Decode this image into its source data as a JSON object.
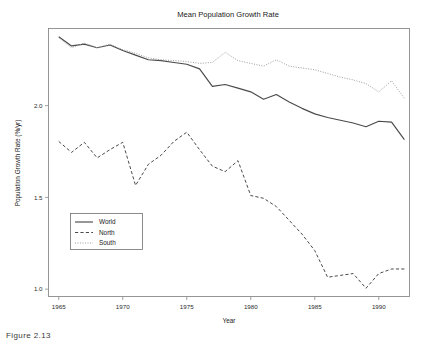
{
  "figure": {
    "caption": "Figure 2.13"
  },
  "chart_data": {
    "type": "line",
    "title": "Mean Population Growth Rate",
    "xlabel": "Year",
    "ylabel": "Population Growth Rate (%/yr)",
    "xlim": [
      1964.2,
      1992.4
    ],
    "ylim": [
      0.96,
      2.42
    ],
    "xticks": [
      1965,
      1970,
      1975,
      1980,
      1985,
      1990
    ],
    "xticklabels": [
      "1965",
      "1970",
      "1975",
      "1980",
      "1985",
      "1990"
    ],
    "yticks": [
      1.0,
      1.5,
      2.0
    ],
    "yticklabels": [
      "1.0",
      "1.5",
      "2.0"
    ],
    "grid": false,
    "legend_position": "lower left",
    "x": [
      1965,
      1966,
      1967,
      1968,
      1969,
      1970,
      1971,
      1972,
      1973,
      1974,
      1975,
      1976,
      1977,
      1978,
      1979,
      1980,
      1981,
      1982,
      1983,
      1984,
      1985,
      1986,
      1987,
      1988,
      1989,
      1990,
      1991,
      1992
    ],
    "series": [
      {
        "name": "World",
        "style": "solid",
        "color": "#4a4a4a",
        "width": 1.15,
        "values": [
          2.375,
          2.325,
          2.335,
          2.315,
          2.33,
          2.3,
          2.275,
          2.25,
          2.245,
          2.235,
          2.225,
          2.2,
          2.105,
          2.115,
          2.095,
          2.075,
          2.035,
          2.06,
          2.02,
          1.985,
          1.955,
          1.935,
          1.92,
          1.905,
          1.885,
          1.915,
          1.91,
          1.815
        ]
      },
      {
        "name": "North",
        "style": "dashed",
        "color": "#4a4a4a",
        "width": 1.0,
        "values": [
          1.805,
          1.745,
          1.8,
          1.715,
          1.76,
          1.8,
          1.565,
          1.68,
          1.73,
          1.805,
          1.855,
          1.76,
          1.67,
          1.64,
          1.7,
          1.51,
          1.495,
          1.45,
          1.375,
          1.3,
          1.21,
          1.065,
          1.075,
          1.085,
          1.005,
          1.085,
          1.11,
          1.11
        ]
      },
      {
        "name": "South",
        "style": "dotted",
        "color": "#9d9d9d",
        "width": 1.0,
        "values": [
          2.37,
          2.315,
          2.34,
          2.315,
          2.335,
          2.305,
          2.285,
          2.26,
          2.25,
          2.245,
          2.24,
          2.23,
          2.235,
          2.29,
          2.245,
          2.23,
          2.215,
          2.25,
          2.215,
          2.205,
          2.195,
          2.175,
          2.155,
          2.14,
          2.12,
          2.075,
          2.135,
          2.04
        ]
      }
    ]
  },
  "legend": {
    "entries": [
      {
        "label": "World"
      },
      {
        "label": "North"
      },
      {
        "label": "South"
      }
    ]
  }
}
